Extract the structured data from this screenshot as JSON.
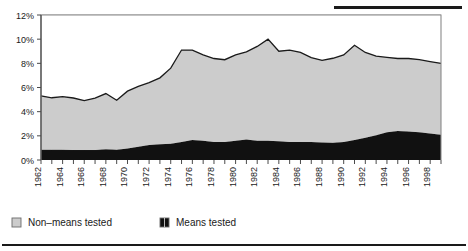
{
  "chart_data": {
    "type": "area",
    "title": "",
    "subtitle": "",
    "xlabel": "",
    "ylabel": "",
    "stacked": true,
    "grid": true,
    "legend_position": "bottom-left",
    "ylim": [
      0,
      12
    ],
    "yticks": [
      0,
      2,
      4,
      6,
      8,
      10,
      12
    ],
    "ytick_labels": [
      "0%",
      "2%",
      "4%",
      "6%",
      "8%",
      "10%",
      "12%"
    ],
    "xlim": [
      1962,
      1999
    ],
    "xticks": [
      1962,
      1963,
      1964,
      1965,
      1966,
      1967,
      1968,
      1969,
      1970,
      1971,
      1972,
      1973,
      1974,
      1975,
      1976,
      1977,
      1978,
      1979,
      1980,
      1981,
      1982,
      1983,
      1984,
      1985,
      1986,
      1987,
      1988,
      1989,
      1990,
      1991,
      1992,
      1993,
      1994,
      1995,
      1996,
      1997,
      1998,
      1999
    ],
    "xtick_labels": [
      "1962",
      "1964",
      "1966",
      "1968",
      "1970",
      "1972",
      "1974",
      "1976",
      "1978",
      "1980",
      "1982",
      "1984",
      "1986",
      "1988",
      "1990",
      "1992",
      "1994",
      "1996",
      "1998"
    ],
    "xtick_label_values": [
      1962,
      1964,
      1966,
      1968,
      1970,
      1972,
      1974,
      1976,
      1978,
      1980,
      1982,
      1984,
      1986,
      1988,
      1990,
      1992,
      1994,
      1996,
      1998
    ],
    "x": [
      1962,
      1963,
      1964,
      1965,
      1966,
      1967,
      1968,
      1969,
      1970,
      1971,
      1972,
      1973,
      1974,
      1975,
      1976,
      1977,
      1978,
      1979,
      1980,
      1981,
      1982,
      1983,
      1984,
      1985,
      1986,
      1987,
      1988,
      1989,
      1990,
      1991,
      1992,
      1993,
      1994,
      1995,
      1996,
      1997,
      1998,
      1999
    ],
    "series": [
      {
        "name": "Means tested",
        "color": "#111111",
        "values": [
          0.85,
          0.85,
          0.85,
          0.83,
          0.82,
          0.82,
          0.9,
          0.85,
          0.95,
          1.1,
          1.25,
          1.3,
          1.35,
          1.5,
          1.65,
          1.6,
          1.5,
          1.5,
          1.6,
          1.7,
          1.6,
          1.6,
          1.55,
          1.5,
          1.5,
          1.48,
          1.45,
          1.42,
          1.5,
          1.65,
          1.85,
          2.05,
          2.3,
          2.4,
          2.35,
          2.3,
          2.2,
          2.1
        ]
      },
      {
        "name": "Non-means tested",
        "color": "#cccccc",
        "values": [
          4.45,
          4.3,
          4.4,
          4.3,
          4.1,
          4.3,
          4.6,
          4.1,
          4.75,
          5.0,
          5.15,
          5.5,
          6.25,
          7.6,
          7.45,
          7.1,
          6.9,
          6.8,
          7.1,
          7.25,
          7.8,
          8.4,
          7.45,
          7.6,
          7.4,
          7.0,
          6.8,
          7.0,
          7.2,
          7.85,
          7.05,
          6.55,
          6.2,
          6.0,
          6.05,
          6.0,
          5.95,
          5.9
        ]
      }
    ],
    "totals": [
      5.3,
      5.15,
      5.25,
      5.13,
      4.92,
      5.12,
      5.5,
      4.95,
      5.7,
      6.1,
      6.4,
      6.8,
      7.6,
      9.1,
      9.1,
      8.7,
      8.4,
      8.3,
      8.7,
      8.95,
      9.4,
      10.0,
      9.0,
      9.1,
      8.9,
      8.48,
      8.25,
      8.42,
      8.7,
      9.5,
      8.9,
      8.6,
      8.5,
      8.4,
      8.4,
      8.3,
      8.15,
      8.0
    ]
  },
  "legend": {
    "items": [
      {
        "label": "Non–means tested",
        "color": "#cccccc"
      },
      {
        "label": "Means tested",
        "color": "#111111"
      }
    ]
  }
}
